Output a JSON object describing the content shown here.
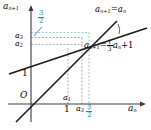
{
  "figure": {
    "type": "cobweb-fixed-point-plot",
    "axes": {
      "y_label": "a",
      "y_label_sub": "n+1",
      "x_label": "a",
      "x_label_sub": "n",
      "origin_label": "O"
    },
    "lines": [
      {
        "id": "identity-line",
        "label_lhs": "a",
        "label_lhs_sub": "n+1",
        "label_eq": "=",
        "label_rhs": "a",
        "label_rhs_sub": "n",
        "slope": 1,
        "intercept": 0,
        "color": "#1a1a1a"
      },
      {
        "id": "recurrence-line",
        "label_lhs": "a",
        "label_lhs_sub": "n+1",
        "label_eq": "=",
        "label_frac_num": "1",
        "label_frac_den": "3",
        "label_var": "a",
        "label_var_sub": "n",
        "label_plus": "+1",
        "slope": 0.3333,
        "intercept": 1,
        "color": "#1a1a1a"
      }
    ],
    "y_ticks": [
      {
        "id": "y-tick-a3",
        "label": "a",
        "sub": "3"
      },
      {
        "id": "y-tick-a2",
        "label": "a",
        "sub": "2"
      },
      {
        "id": "y-tick-one",
        "label": "1",
        "sub": ""
      }
    ],
    "x_ticks": [
      {
        "id": "x-tick-a1-upper",
        "label": "a",
        "sub": "1"
      },
      {
        "id": "x-tick-one",
        "label": "1",
        "sub": ""
      },
      {
        "id": "x-tick-a3",
        "label": "a",
        "sub": "3"
      }
    ],
    "annotations": [
      {
        "id": "fixed-point-y",
        "num": "3",
        "den": "2",
        "color": "#3a78c9",
        "position": "upper-left"
      },
      {
        "id": "fixed-point-x",
        "num": "3",
        "den": "2",
        "color": "#3a78c9",
        "position": "below-x-axis"
      }
    ],
    "colors": {
      "axis": "#3a3a3a",
      "curve": "#1a1a1a",
      "guide_black": "#8a8a8a",
      "guide_blue": "#7fb0e0",
      "accent_blue": "#3a78c9",
      "background": "#ffffff"
    }
  }
}
